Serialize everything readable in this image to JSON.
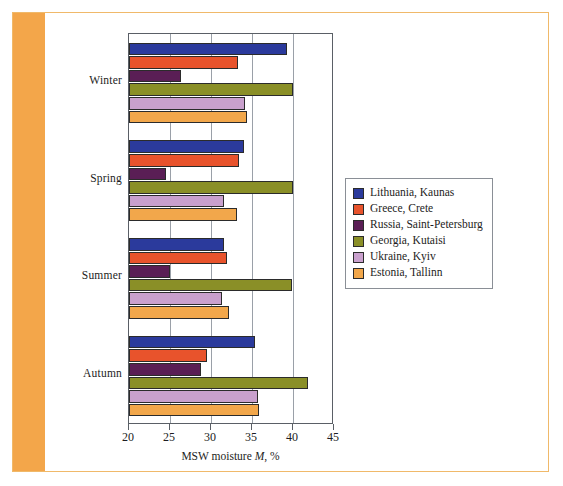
{
  "frame": {
    "band_color": "#f3a64a",
    "border_color": "#f0b96a"
  },
  "chart_data": {
    "type": "bar",
    "orientation": "horizontal",
    "title": "",
    "xlabel": "MSW moisture M, %",
    "ylabel": "",
    "xlim": [
      20,
      45
    ],
    "xticks": [
      20,
      25,
      30,
      35,
      40,
      45
    ],
    "grid": true,
    "grid_axis": "x",
    "legend_position": "right",
    "categories": [
      "Winter",
      "Spring",
      "Summer",
      "Autumn"
    ],
    "series": [
      {
        "name": "Lithuania, Kaunas",
        "color": "#2b3a9c",
        "values": [
          39.3,
          34.0,
          31.6,
          35.4
        ]
      },
      {
        "name": "Greece, Crete",
        "color": "#e8301c",
        "values": [
          33.3,
          33.4,
          32.0,
          29.5
        ]
      },
      {
        "name": "Russia, Saint-Petersburg",
        "color": "#5a1e55",
        "values": [
          26.3,
          24.5,
          25.0,
          28.8
        ]
      },
      {
        "name": "Georgia, Kutaisi",
        "color": "#8a8f27",
        "values": [
          40.0,
          40.0,
          39.9,
          41.8
        ]
      },
      {
        "name": "Ukraine, Kyiv",
        "color": "#c9a0cd",
        "values": [
          34.1,
          31.6,
          31.3,
          35.7
        ]
      },
      {
        "name": "Estonia, Tallinn",
        "color": "#f8b濃",
        "values": [
          34.4,
          33.2,
          32.2,
          35.9
        ]
      }
    ]
  },
  "legend": {
    "items": [
      {
        "label": "Lithuania, Kaunas",
        "color": "#2b3a9c"
      },
      {
        "label": "Greece, Crete",
        "color": "#e8532c"
      },
      {
        "label": "Russia, Saint-Petersburg",
        "color": "#5a1e55"
      },
      {
        "label": "Georgia, Kutaisi",
        "color": "#8a8f27"
      },
      {
        "label": "Ukraine, Kyiv",
        "color": "#c9a0cd"
      },
      {
        "label": "Estonia, Tallinn",
        "color": "#f2a74b"
      }
    ]
  },
  "axis": {
    "x_title_prefix": "MSW moisture ",
    "x_title_italic": "M",
    "x_title_suffix": ", %"
  }
}
